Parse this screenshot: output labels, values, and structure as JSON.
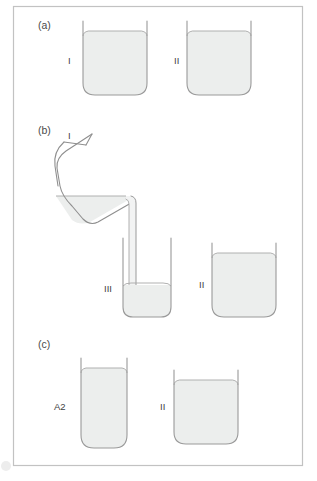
{
  "figure": {
    "border_color": "#bdbdbd",
    "background": "#ffffff",
    "outline_color": "#9a9a9a",
    "liquid_fill": "#eceeed",
    "liquid_edge": "#a6a6a6",
    "corner_smudge_color": "#e2e2e2"
  },
  "panels": [
    {
      "key": "a",
      "label": "(a)",
      "label_x": 38,
      "label_y": 29,
      "vessels": [
        {
          "name": "vessel-a-I",
          "label": "I",
          "label_x": 68,
          "label_y": 64,
          "x": 82,
          "y": 21,
          "width": 66,
          "height": 75,
          "radius": 13,
          "liquid_top": 36
        },
        {
          "name": "vessel-a-II",
          "label": "II",
          "label_x": 174,
          "label_y": 64,
          "x": 186,
          "y": 21,
          "width": 66,
          "height": 75,
          "radius": 13,
          "liquid_top": 36
        }
      ]
    },
    {
      "key": "b",
      "label": "(b)",
      "label_x": 38,
      "label_y": 134,
      "vessels": [
        {
          "name": "vessel-b-I-pouring",
          "label": "I",
          "label_x": 68,
          "label_y": 139,
          "tilted": true
        },
        {
          "name": "vessel-b-III",
          "label": "III",
          "label_x": 104,
          "label_y": 292,
          "x": 122,
          "y": 238,
          "width": 50,
          "height": 80,
          "radius": 12,
          "liquid_top": 285
        },
        {
          "name": "vessel-b-II",
          "label": "II",
          "label_x": 199,
          "label_y": 288,
          "x": 211,
          "y": 243,
          "width": 66,
          "height": 75,
          "radius": 13,
          "liquid_top": 258
        }
      ]
    },
    {
      "key": "c",
      "label": "(c)",
      "label_x": 38,
      "label_y": 348,
      "vessels": [
        {
          "name": "vessel-c-A2",
          "label": "A2",
          "label_x": 54,
          "label_y": 410,
          "x": 80,
          "y": 358,
          "width": 48,
          "height": 90,
          "radius": 13,
          "liquid_top": 373
        },
        {
          "name": "vessel-c-II",
          "label": "II",
          "label_x": 160,
          "label_y": 410,
          "x": 173,
          "y": 370,
          "width": 66,
          "height": 75,
          "radius": 13,
          "liquid_top": 385
        }
      ]
    }
  ],
  "border": {
    "x": 13,
    "y": 6,
    "width": 290,
    "height": 460
  }
}
